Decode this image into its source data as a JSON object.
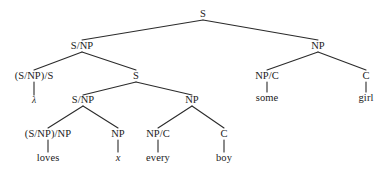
{
  "figure": {
    "kind": "syntax-derivation-tree",
    "background_color": "#ffffff",
    "line_color": "#2b2b2b",
    "text_color": "#1a1a1a",
    "width": 386,
    "height": 184
  },
  "nodes": {
    "root_s": "S",
    "l2_snp": "S/NP",
    "l2_np": "NP",
    "l3_snp_s": "(S/NP)/S",
    "l3_s": "S",
    "l3_np_c": "NP/C",
    "l3_c": "C",
    "l4_lambda": "λ",
    "l4_snp": "S/NP",
    "l4_np": "NP",
    "l4_some": "some",
    "l4_girl": "girl",
    "l5_snp_np": "(S/NP)/NP",
    "l5_np": "NP",
    "l5_np_c": "NP/C",
    "l5_c": "C",
    "l6_loves": "loves",
    "l6_x": "x",
    "l6_every": "every",
    "l6_boy": "boy"
  },
  "edges": [
    {
      "from": "root_s",
      "to": "l2_snp",
      "x1": 203,
      "y1": 20,
      "x2": 82,
      "y2": 40
    },
    {
      "from": "root_s",
      "to": "l2_np",
      "x1": 203,
      "y1": 20,
      "x2": 318,
      "y2": 40
    },
    {
      "from": "l2_snp",
      "to": "l3_snp_s",
      "x1": 82,
      "y1": 52,
      "x2": 34,
      "y2": 70
    },
    {
      "from": "l2_snp",
      "to": "l3_s",
      "x1": 82,
      "y1": 52,
      "x2": 136,
      "y2": 70
    },
    {
      "from": "l2_np",
      "to": "l3_np_c",
      "x1": 318,
      "y1": 52,
      "x2": 267,
      "y2": 70
    },
    {
      "from": "l2_np",
      "to": "l3_c",
      "x1": 318,
      "y1": 52,
      "x2": 366,
      "y2": 70
    },
    {
      "from": "l3_snp_s",
      "to": "l4_lambda",
      "x1": 34,
      "y1": 82,
      "x2": 34,
      "y2": 95
    },
    {
      "from": "l3_s",
      "to": "l4_snp",
      "x1": 136,
      "y1": 82,
      "x2": 83,
      "y2": 95
    },
    {
      "from": "l3_s",
      "to": "l4_np",
      "x1": 136,
      "y1": 82,
      "x2": 192,
      "y2": 95
    },
    {
      "from": "l3_np_c",
      "to": "l4_some",
      "x1": 267,
      "y1": 82,
      "x2": 267,
      "y2": 92
    },
    {
      "from": "l3_c",
      "to": "l4_girl",
      "x1": 366,
      "y1": 82,
      "x2": 366,
      "y2": 92
    },
    {
      "from": "l4_snp",
      "to": "l5_snp_np",
      "x1": 83,
      "y1": 106,
      "x2": 48,
      "y2": 128
    },
    {
      "from": "l4_snp",
      "to": "l5_np",
      "x1": 83,
      "y1": 106,
      "x2": 118,
      "y2": 128
    },
    {
      "from": "l4_np",
      "to": "l5_np_c",
      "x1": 192,
      "y1": 106,
      "x2": 158,
      "y2": 128
    },
    {
      "from": "l4_np",
      "to": "l5_c",
      "x1": 192,
      "y1": 106,
      "x2": 224,
      "y2": 128
    },
    {
      "from": "l5_snp_np",
      "to": "l6_loves",
      "x1": 48,
      "y1": 140,
      "x2": 48,
      "y2": 152
    },
    {
      "from": "l5_np",
      "to": "l6_x",
      "x1": 118,
      "y1": 140,
      "x2": 118,
      "y2": 152
    },
    {
      "from": "l5_np_c",
      "to": "l6_every",
      "x1": 158,
      "y1": 140,
      "x2": 158,
      "y2": 152
    },
    {
      "from": "l5_c",
      "to": "l6_boy",
      "x1": 224,
      "y1": 140,
      "x2": 224,
      "y2": 152
    }
  ],
  "positions": {
    "root_s": {
      "x": 203,
      "y": 14
    },
    "l2_snp": {
      "x": 82,
      "y": 46
    },
    "l2_np": {
      "x": 318,
      "y": 46
    },
    "l3_snp_s": {
      "x": 34,
      "y": 76
    },
    "l3_s": {
      "x": 136,
      "y": 76
    },
    "l3_np_c": {
      "x": 267,
      "y": 76
    },
    "l3_c": {
      "x": 366,
      "y": 76
    },
    "l4_lambda": {
      "x": 34,
      "y": 101
    },
    "l4_snp": {
      "x": 83,
      "y": 100
    },
    "l4_np": {
      "x": 192,
      "y": 100
    },
    "l4_some": {
      "x": 267,
      "y": 98
    },
    "l4_girl": {
      "x": 366,
      "y": 98
    },
    "l5_snp_np": {
      "x": 48,
      "y": 134
    },
    "l5_np": {
      "x": 118,
      "y": 134
    },
    "l5_np_c": {
      "x": 158,
      "y": 134
    },
    "l5_c": {
      "x": 224,
      "y": 134
    },
    "l6_loves": {
      "x": 48,
      "y": 158
    },
    "l6_x": {
      "x": 118,
      "y": 158
    },
    "l6_every": {
      "x": 158,
      "y": 158
    },
    "l6_boy": {
      "x": 224,
      "y": 158
    }
  }
}
